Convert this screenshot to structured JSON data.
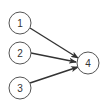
{
  "diagram": {
    "type": "directed-graph",
    "nodes": [
      {
        "id": "1",
        "label": "1",
        "cx": 20,
        "cy": 23
      },
      {
        "id": "2",
        "label": "2",
        "cx": 20,
        "cy": 53
      },
      {
        "id": "3",
        "label": "3",
        "cx": 20,
        "cy": 88
      },
      {
        "id": "4",
        "label": "4",
        "cx": 88,
        "cy": 63
      }
    ],
    "edges": [
      {
        "from": "1",
        "to": "4"
      },
      {
        "from": "2",
        "to": "4"
      },
      {
        "from": "3",
        "to": "4"
      }
    ],
    "node_radius": 11,
    "colors": {
      "node_stroke": "#555555",
      "edge": "#333333",
      "label": "#333333"
    }
  }
}
